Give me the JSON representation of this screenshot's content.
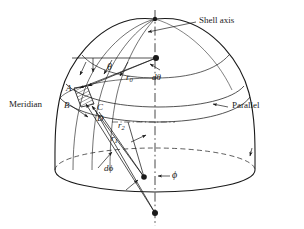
{
  "figure": {
    "type": "engineering-diagram",
    "background_color": "#ffffff",
    "line_color": "#1a1a1a",
    "hatch_color": "#1a1a1a"
  },
  "callouts": {
    "shell_axis": "Shell axis",
    "meridian": "Meridian",
    "parallel": "Parallel"
  },
  "symbols": {
    "theta": "θ",
    "d_theta_d": "d",
    "d_theta_sym": "θ",
    "phi": "ϕ",
    "d_phi_d": "d",
    "d_phi_sym": "ϕ",
    "r0_base": "r",
    "r0_sub": "0",
    "r1_base": "r",
    "r1_sub": "1",
    "r2_base": "r",
    "r2_sub": "2"
  },
  "element_vertices": {
    "a": "A",
    "b": "B",
    "c": "C",
    "d": "D"
  },
  "geometry": {
    "axis_x": 155,
    "apex_top": {
      "x": 155,
      "y": 19
    },
    "center_dot": {
      "x": 156,
      "y": 58
    },
    "mid_dot": {
      "x": 144,
      "y": 177
    },
    "bottom_dot": {
      "x": 155,
      "y": 213
    },
    "base_center": {
      "x": 155,
      "y": 170
    },
    "base_rx": 100,
    "base_ry": 22
  }
}
